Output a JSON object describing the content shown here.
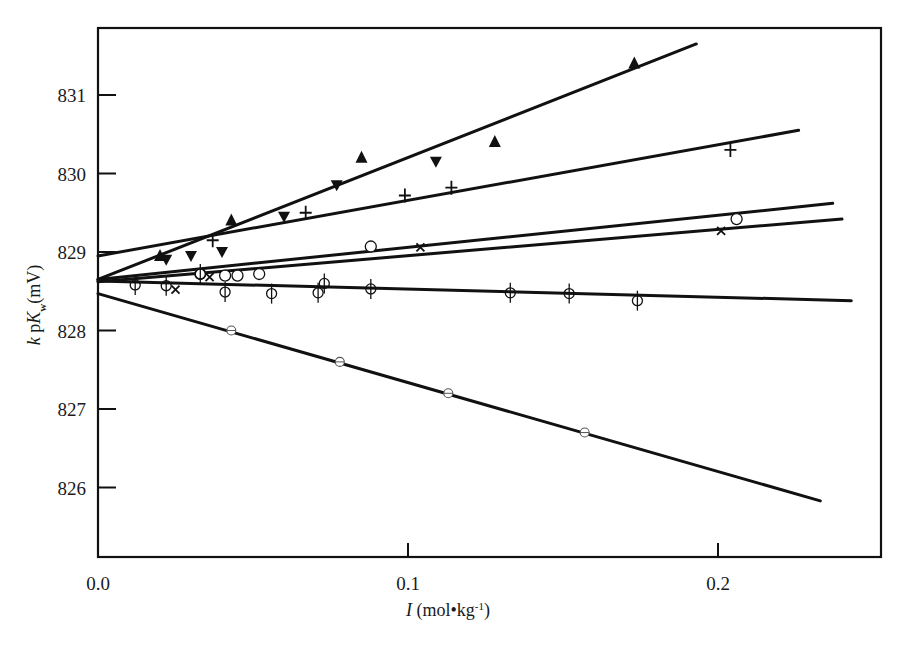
{
  "chart_data": {
    "type": "scatter",
    "title": "",
    "xlabel": "I (mol•kg⁻¹)",
    "xlabel_parts": {
      "italic": "I",
      "rest": " (mol•kg",
      "sup": "-1",
      "close": ")"
    },
    "ylabel": "k pK_w (mV)",
    "ylabel_parts": {
      "k": "k",
      "p": " p",
      "K": "K",
      "sub": "w",
      "unit": "(mV)"
    },
    "xlim": [
      0.0,
      0.252
    ],
    "ylim": [
      825.4,
      832.1
    ],
    "grid": false,
    "legend": null,
    "x_ticks": [
      {
        "value": 0.0,
        "label": "0.0"
      },
      {
        "value": 0.1,
        "label": "0.1"
      },
      {
        "value": 0.2,
        "label": "0.2"
      }
    ],
    "y_ticks": [
      {
        "value": 826,
        "label": "826"
      },
      {
        "value": 827,
        "label": "827"
      },
      {
        "value": 828,
        "label": "828"
      },
      {
        "value": 829,
        "label": "829"
      },
      {
        "value": 830,
        "label": "830"
      },
      {
        "value": 831,
        "label": "831"
      }
    ],
    "series": [
      {
        "name": "filled-up-triangle",
        "marker": "triangle-up-filled",
        "fit": {
          "x": [
            0.0,
            0.193
          ],
          "y": [
            828.65,
            831.65
          ]
        },
        "points": [
          [
            0.02,
            828.95
          ],
          [
            0.043,
            829.4
          ],
          [
            0.085,
            830.2
          ],
          [
            0.128,
            830.4
          ],
          [
            0.173,
            831.4
          ]
        ]
      },
      {
        "name": "filled-down-triangle",
        "marker": "triangle-down-filled",
        "fit": null,
        "points": [
          [
            0.022,
            828.9
          ],
          [
            0.03,
            828.95
          ],
          [
            0.04,
            829.0
          ],
          [
            0.06,
            829.45
          ],
          [
            0.077,
            829.85
          ],
          [
            0.109,
            830.15
          ]
        ]
      },
      {
        "name": "plus",
        "marker": "plus",
        "fit": {
          "x": [
            0.0,
            0.226
          ],
          "y": [
            828.95,
            830.55
          ]
        },
        "points": [
          [
            0.037,
            829.15
          ],
          [
            0.067,
            829.5
          ],
          [
            0.099,
            829.72
          ],
          [
            0.114,
            829.82
          ],
          [
            0.204,
            830.3
          ]
        ]
      },
      {
        "name": "open-circle",
        "marker": "circle-open",
        "fit": {
          "x": [
            0.0,
            0.237
          ],
          "y": [
            828.65,
            829.62
          ]
        },
        "points": [
          [
            0.033,
            828.72
          ],
          [
            0.041,
            828.7
          ],
          [
            0.045,
            828.7
          ],
          [
            0.052,
            828.72
          ],
          [
            0.088,
            829.07
          ],
          [
            0.206,
            829.42
          ]
        ]
      },
      {
        "name": "cross",
        "marker": "x",
        "fit": {
          "x": [
            0.0,
            0.24
          ],
          "y": [
            828.62,
            829.42
          ]
        },
        "points": [
          [
            0.025,
            828.52
          ],
          [
            0.036,
            828.68
          ],
          [
            0.104,
            829.06
          ],
          [
            0.201,
            829.27
          ]
        ]
      },
      {
        "name": "circle-with-errorbar",
        "marker": "circle-vbar",
        "fit": {
          "x": [
            0.0,
            0.243
          ],
          "y": [
            828.63,
            828.38
          ]
        },
        "points": [
          [
            0.012,
            828.58
          ],
          [
            0.022,
            828.57
          ],
          [
            0.033,
            828.72
          ],
          [
            0.041,
            828.49
          ],
          [
            0.056,
            828.47
          ],
          [
            0.071,
            828.48
          ],
          [
            0.073,
            828.6
          ],
          [
            0.088,
            828.53
          ],
          [
            0.133,
            828.48
          ],
          [
            0.152,
            828.47
          ],
          [
            0.174,
            828.38
          ]
        ]
      },
      {
        "name": "small-open-circle",
        "marker": "circle-small",
        "fit": {
          "x": [
            0.0,
            0.233
          ],
          "y": [
            828.47,
            825.83
          ]
        },
        "points": [
          [
            0.043,
            828.0
          ],
          [
            0.078,
            827.6
          ],
          [
            0.113,
            827.2
          ],
          [
            0.157,
            826.7
          ]
        ]
      }
    ]
  },
  "colors": {
    "ink": "#111111",
    "background": "#ffffff"
  }
}
